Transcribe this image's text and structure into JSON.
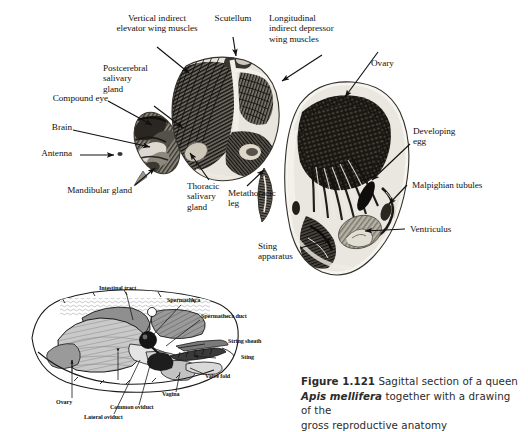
{
  "figure": {
    "number": "Figure 1.121",
    "caption_part1": "Sagittal section of a queen",
    "caption_species": "Apis mellifera",
    "caption_part2": "together with a drawing of the",
    "caption_part3": "gross reproductive anatomy",
    "caption_full": "Figure 1.121 Sagittal section of a queen Apis mellifera together with a drawing of the gross reproductive anatomy"
  },
  "photo_labels": {
    "vertical_indirect": "Vertical indirect\nelevator wing muscles",
    "scutellum": "Scutellum",
    "longitudinal": "Longitudinal\nindirect depressor\nwing muscles",
    "ovary": "Ovary",
    "postcerebral": "Postcerebral\nsalivary\ngland",
    "compound_eye": "Compound eye",
    "brain": "Brain",
    "antenna": "Antenna",
    "mandibular": "Mandibular gland",
    "thoracic_salivary": "Thoracic\nsalivary\ngland",
    "metathoracic": "Metathoracic\nleg",
    "developing_egg": "Developing\negg",
    "malpighian": "Malpighian tubules",
    "ventriculus": "Ventriculus",
    "sting_apparatus": "Sting\napparatus"
  },
  "drawing_labels": {
    "intestinal": "Intestinal tract",
    "spermatheca": "Spermatheca",
    "spermatheca_duct": "Spermatheca duct",
    "string_sheath": "String sheath",
    "sting": "Sting",
    "valve_fold": "Valve fold",
    "vagina": "Vagina",
    "common_oviduct": "Common oviduct",
    "lateral_oviduct": "Lateral oviduct",
    "ovary": "Ovary"
  },
  "colors": {
    "background": "#ffffff",
    "ink": "#111111",
    "caption_text": "#2b2b2b",
    "tissue_dark": "#1c1c1c",
    "tissue_mid": "#6f6f6f",
    "tissue_light": "#d8d4cc",
    "drawing_dark_gray": "#8f8f8f",
    "drawing_light_gray": "#c8c8c8",
    "drawing_pale": "#dcdcdc",
    "drawing_black": "#1a1a1a"
  }
}
